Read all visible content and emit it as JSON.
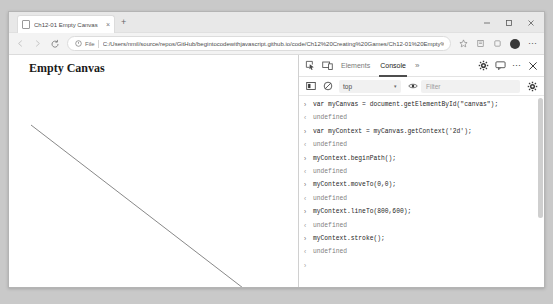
{
  "browser": {
    "tab": {
      "title": "Ch12-01 Empty Canvas",
      "favicon_icon": "page-icon",
      "close_label": "×"
    },
    "new_tab_label": "+",
    "window_controls": {
      "minimize_label": "─",
      "maximize_label": "□",
      "close_label": "✕"
    },
    "nav": {
      "back_icon": "arrow-left-icon",
      "forward_icon": "arrow-right-icon",
      "reload_icon": "reload-icon",
      "scheme_label": "File",
      "url": "C:/Users/nmil/source/repos/GitHub/begintocodewithjavascript.github.io/code/Ch12%20Creating%20Games/Ch12-01%20Empty%20Canvas/index.html",
      "favorite_icon": "star-icon",
      "collections_icon": "collections-icon",
      "extensions_icon": "extensions-icon",
      "profile_icon": "avatar-icon",
      "settings_label": "⋯"
    }
  },
  "page": {
    "heading": "Empty Canvas",
    "canvas": {
      "line_from": [
        0,
        0
      ],
      "line_to": [
        800,
        600
      ],
      "stroke_color": "#767676"
    }
  },
  "devtools": {
    "toolbar": {
      "inspect_icon": "inspect-element-icon",
      "device_icon": "device-toolbar-icon",
      "tabs": [
        {
          "label": "Elements",
          "active": false
        },
        {
          "label": "Console",
          "active": true
        }
      ],
      "overflow_label": "»",
      "settings_icon": "gear-icon",
      "feedback_icon": "feedback-icon",
      "more_label": "⋯",
      "close_label": "✕"
    },
    "console_toolbar": {
      "sidebar_icon": "console-sidebar-icon",
      "clear_icon": "clear-console-icon",
      "context": "top",
      "context_caret": "▾",
      "eye_icon": "live-expression-icon",
      "filter_placeholder": "Filter",
      "settings_icon": "gear-icon"
    },
    "log": [
      {
        "type": "input",
        "marker": "›",
        "text": "var myCanvas = document.getElementById(\"canvas\");"
      },
      {
        "type": "output",
        "marker": "‹",
        "text": "undefined"
      },
      {
        "type": "input",
        "marker": "›",
        "text": "var myContext = myCanvas.getContext('2d');"
      },
      {
        "type": "output",
        "marker": "‹",
        "text": "undefined"
      },
      {
        "type": "input",
        "marker": "›",
        "text": "myContext.beginPath();"
      },
      {
        "type": "output",
        "marker": "‹",
        "text": "undefined"
      },
      {
        "type": "input",
        "marker": "›",
        "text": "myContext.moveTo(0,0);"
      },
      {
        "type": "output",
        "marker": "‹",
        "text": "undefined"
      },
      {
        "type": "input",
        "marker": "›",
        "text": "myContext.lineTo(800,600);"
      },
      {
        "type": "output",
        "marker": "‹",
        "text": "undefined"
      },
      {
        "type": "input",
        "marker": "›",
        "text": "myContext.stroke();"
      },
      {
        "type": "output",
        "marker": "‹",
        "text": "undefined"
      },
      {
        "type": "prompt",
        "marker": "›",
        "text": ""
      }
    ]
  }
}
